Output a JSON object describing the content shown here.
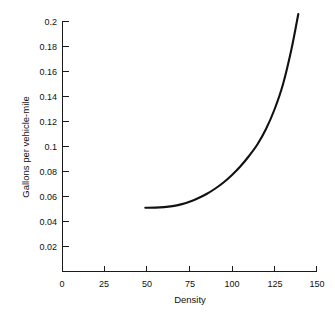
{
  "chart_data": {
    "type": "line",
    "title": "",
    "xlabel": "Density",
    "ylabel": "Gallons per vehicle-mile",
    "xlim": [
      0,
      150
    ],
    "ylim": [
      0,
      0.2
    ],
    "grid": false,
    "legend": "none",
    "xticks": [
      0,
      25,
      50,
      75,
      100,
      125,
      150
    ],
    "xtick_labels": [
      "0",
      "25",
      "50",
      "75",
      "100",
      "125",
      "150"
    ],
    "yticks": [
      0,
      0.02,
      0.04,
      0.06,
      0.08,
      0.1,
      0.12,
      0.14,
      0.16,
      0.18,
      0.2
    ],
    "ytick_labels": [
      "0",
      "0.02",
      "0.04",
      "0.06",
      "0.08",
      "0.1",
      "0.12",
      "0.14",
      "0.16",
      "0.18",
      "0.2"
    ],
    "series": [
      {
        "name": "Fuel consumption vs density",
        "x": [
          49,
          55,
          60,
          65,
          70,
          75,
          80,
          85,
          90,
          95,
          100,
          105,
          110,
          115,
          120,
          125,
          130,
          135,
          139
        ],
        "y": [
          0.051,
          0.0511,
          0.0515,
          0.0523,
          0.0537,
          0.0558,
          0.0586,
          0.062,
          0.0662,
          0.0712,
          0.0772,
          0.0842,
          0.0924,
          0.1018,
          0.114,
          0.1296,
          0.1498,
          0.178,
          0.206
        ],
        "color": "#111111"
      }
    ],
    "curve_start": {
      "x": 49,
      "y": 0.051
    },
    "curve_end": {
      "x": 139,
      "y": 0.206
    }
  },
  "axis_titles": {
    "x": "Density",
    "y": "Gallons per vehicle-mile"
  }
}
